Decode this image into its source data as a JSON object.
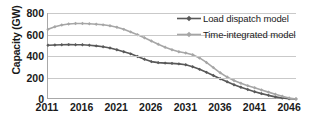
{
  "chart_data": {
    "type": "line",
    "title": "",
    "xlabel": "",
    "ylabel": "Capacity (GW)",
    "ylim": [
      0,
      800
    ],
    "ytick_labels": [
      "800",
      "600",
      "400",
      "200",
      "0"
    ],
    "ytick_values": [
      800,
      600,
      400,
      200,
      0
    ],
    "xtick_labels": [
      "2011",
      "2016",
      "2021",
      "2026",
      "2031",
      "2036",
      "2041",
      "2046"
    ],
    "xtick_values": [
      2011,
      2016,
      2021,
      2026,
      2031,
      2036,
      2041,
      2046
    ],
    "xlim": [
      2011,
      2047
    ],
    "grid": "horizontal",
    "legend_position": "top-right",
    "x": [
      2011,
      2012,
      2013,
      2014,
      2015,
      2016,
      2017,
      2018,
      2019,
      2020,
      2021,
      2022,
      2023,
      2024,
      2025,
      2026,
      2027,
      2028,
      2029,
      2030,
      2031,
      2032,
      2033,
      2034,
      2035,
      2036,
      2037,
      2038,
      2039,
      2040,
      2041,
      2042,
      2043,
      2044,
      2045,
      2046,
      2047
    ],
    "series": [
      {
        "name": "Load dispatch model",
        "color": "#595959",
        "marker": "diamond",
        "values": [
          500,
          503,
          505,
          506,
          505,
          504,
          500,
          494,
          486,
          474,
          458,
          440,
          420,
          396,
          370,
          348,
          338,
          334,
          331,
          327,
          318,
          300,
          276,
          248,
          218,
          188,
          160,
          133,
          110,
          88,
          68,
          50,
          34,
          20,
          9,
          2,
          0
        ]
      },
      {
        "name": "Time-integrated model",
        "color": "#a6a6a6",
        "marker": "diamond",
        "values": [
          648,
          672,
          688,
          697,
          702,
          703,
          700,
          695,
          690,
          682,
          668,
          648,
          624,
          598,
          570,
          540,
          510,
          482,
          458,
          440,
          428,
          412,
          382,
          340,
          292,
          244,
          204,
          172,
          146,
          124,
          104,
          84,
          64,
          44,
          26,
          10,
          0
        ]
      }
    ]
  },
  "legend": {
    "entries": [
      {
        "label": "Load dispatch model",
        "color": "#595959"
      },
      {
        "label": "Time-integrated model",
        "color": "#a6a6a6"
      }
    ]
  },
  "axes": {
    "y_title": "Capacity (GW)"
  }
}
